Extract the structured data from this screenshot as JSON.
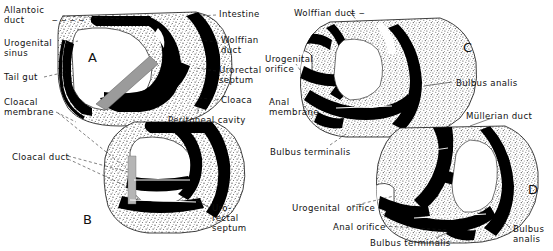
{
  "figure": {
    "type": "anatomical-diagram",
    "background_color": "#ffffff",
    "ink_color": "#111111",
    "stipple_color": "#4a4a4a",
    "duct_color": "#000000",
    "septum_color": "#9b9b9b"
  },
  "panels": [
    {
      "letter": "A",
      "x": 88,
      "y": 50
    },
    {
      "letter": "B",
      "x": 83,
      "y": 212
    },
    {
      "letter": "C",
      "x": 463,
      "y": 40
    },
    {
      "letter": "D",
      "x": 528,
      "y": 182
    }
  ],
  "labels": [
    {
      "id": "allantoic-duct",
      "text": "Allantoic\nduct",
      "x": 4,
      "y": 6,
      "align": "left"
    },
    {
      "id": "urogenital-sinus",
      "text": "Urogenital\nsinus",
      "x": 4,
      "y": 39,
      "align": "left"
    },
    {
      "id": "tail-gut",
      "text": "Tail gut",
      "x": 4,
      "y": 73,
      "align": "left"
    },
    {
      "id": "cloacal-membrane",
      "text": "Cloacal\nmembrane",
      "x": 4,
      "y": 98,
      "align": "left"
    },
    {
      "id": "cloacal-duct",
      "text": "Cloacal duct",
      "x": 12,
      "y": 153,
      "align": "left"
    },
    {
      "id": "intestine",
      "text": "Intestine",
      "x": 219,
      "y": 10,
      "align": "left"
    },
    {
      "id": "wolffian-duct-a",
      "text": "Wolffian\nduct",
      "x": 221,
      "y": 36,
      "align": "left"
    },
    {
      "id": "urorectal-septum-a",
      "text": "Urorectal\nseptum",
      "x": 219,
      "y": 66,
      "align": "left"
    },
    {
      "id": "cloaca",
      "text": "Cloaca",
      "x": 221,
      "y": 96,
      "align": "left"
    },
    {
      "id": "peritoneal-cavity",
      "text": "Peritoneal cavity",
      "x": 168,
      "y": 116,
      "align": "left"
    },
    {
      "id": "urorectal-septum-b",
      "text": "Uro-\nrectal\nseptum",
      "x": 212,
      "y": 204,
      "align": "left"
    },
    {
      "id": "wolffian-duct-c",
      "text": "Wolffian duct",
      "x": 294,
      "y": 9,
      "align": "left"
    },
    {
      "id": "urogenital-orifice-c",
      "text": "Urogenital\norifice",
      "x": 265,
      "y": 55,
      "align": "left"
    },
    {
      "id": "anal-membrane",
      "text": "Anal\nmembrane",
      "x": 269,
      "y": 98,
      "align": "left"
    },
    {
      "id": "bulbus-analis-c",
      "text": "Bulbus analis",
      "x": 456,
      "y": 79,
      "align": "left"
    },
    {
      "id": "mullerian-duct",
      "text": "Müllerian duct",
      "x": 466,
      "y": 112,
      "align": "left"
    },
    {
      "id": "bulbus-terminalis-c",
      "text": "Bulbus terminalis",
      "x": 270,
      "y": 148,
      "align": "left"
    },
    {
      "id": "urogenital-orifice-d",
      "text": "Urogenital  orifice",
      "x": 292,
      "y": 204,
      "align": "left"
    },
    {
      "id": "anal-orifice",
      "text": "Anal orifice",
      "x": 333,
      "y": 223,
      "align": "left"
    },
    {
      "id": "bulbus-terminalis-d",
      "text": "Bulbus terminalis",
      "x": 370,
      "y": 239,
      "align": "left"
    },
    {
      "id": "bulbus-analis-d",
      "text": "Bulbus\nanalis",
      "x": 513,
      "y": 225,
      "align": "left"
    }
  ]
}
